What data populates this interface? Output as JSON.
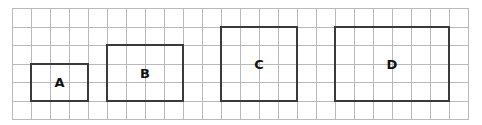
{
  "grid": {
    "columns": 24,
    "rows": 6,
    "cell_width": 19,
    "cell_height": 18.5,
    "line_color": "#b9b9b9"
  },
  "shapes": [
    {
      "label": "A",
      "col": 1,
      "row": 3,
      "width_cells": 3,
      "height_cells": 2
    },
    {
      "label": "B",
      "col": 5,
      "row": 2,
      "width_cells": 4,
      "height_cells": 3
    },
    {
      "label": "C",
      "col": 11,
      "row": 1,
      "width_cells": 4,
      "height_cells": 4
    },
    {
      "label": "D",
      "col": 17,
      "row": 1,
      "width_cells": 6,
      "height_cells": 4
    }
  ]
}
